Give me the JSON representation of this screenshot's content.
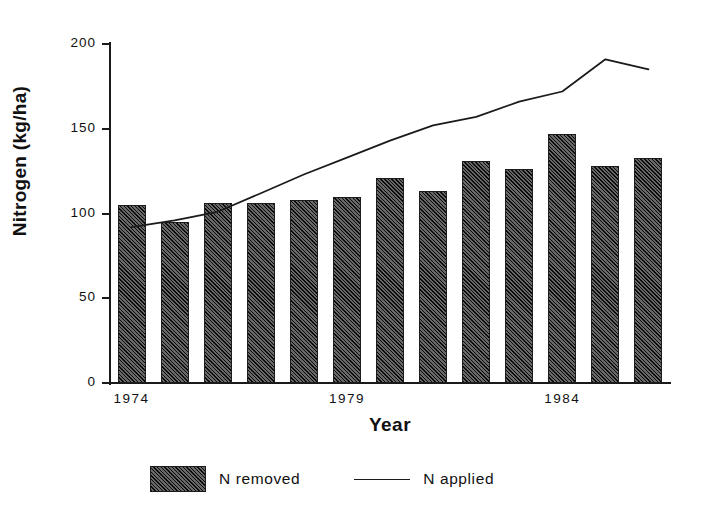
{
  "chart_data": {
    "type": "bar",
    "title": "",
    "xlabel": "Year",
    "ylabel": "Nitrogen (kg/ha)",
    "ylim": [
      0,
      200
    ],
    "yticks": [
      0,
      50,
      100,
      150,
      200
    ],
    "ytick_labels": [
      "0",
      "50",
      "100",
      "150",
      "200"
    ],
    "xtick_labels": [
      "1974",
      "1979",
      "1984"
    ],
    "xtick_categories": [
      "1974",
      "1979",
      "1984"
    ],
    "grid": false,
    "legend_position": "bottom",
    "categories": [
      "1974",
      "1975",
      "1976",
      "1977",
      "1978",
      "1979",
      "1980",
      "1981",
      "1982",
      "1983",
      "1984",
      "1985",
      "1986"
    ],
    "series": [
      {
        "name": "N removed",
        "type": "bar",
        "values": [
          105,
          95,
          106,
          106,
          108,
          110,
          121,
          113,
          131,
          126,
          147,
          128,
          133
        ]
      },
      {
        "name": "N applied",
        "type": "line",
        "values": [
          92,
          96,
          101,
          112,
          123,
          133,
          143,
          152,
          157,
          166,
          172,
          191,
          185
        ]
      }
    ],
    "colors": {
      "bar_fill": "#474747",
      "bar_hatch": "#000000",
      "line": "#1a1a1a",
      "axis": "#1a1a1a",
      "background": "#ffffff",
      "text": "#111111"
    }
  },
  "legend": {
    "items": [
      {
        "label": "N removed",
        "marker": "hatched-square-swatch"
      },
      {
        "label": "N applied",
        "marker": "line-swatch"
      }
    ]
  }
}
